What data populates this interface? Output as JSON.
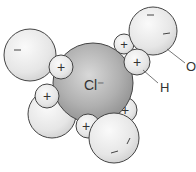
{
  "diagram": {
    "type": "molecular-hydration",
    "central_ion": {
      "label": "Cl⁻",
      "charge": "negative"
    },
    "labels": {
      "oxygen": "O",
      "hydrogen": "H"
    },
    "signs": {
      "plus": "+",
      "minus": "−"
    },
    "colors": {
      "water_fill": "#e8e8e8",
      "ion_fill": "#a8a8a8",
      "outline": "#444444",
      "text": "#333333"
    },
    "water_molecules": 4
  }
}
